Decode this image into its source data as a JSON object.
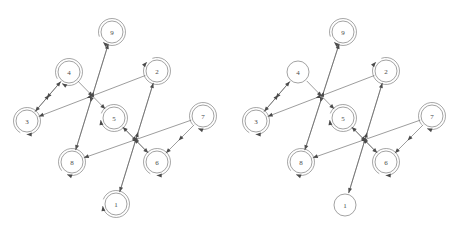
{
  "figure": {
    "title": "",
    "width": 458,
    "height": 232,
    "background": "#ffffff",
    "panel_count": 2
  },
  "style": {
    "edge_color": "#5a5a5a",
    "node_stroke": "#7a7a7a",
    "node_fill": "#ffffff",
    "label_color": "#4a4a4a",
    "arrow_color": "#4a4a4a",
    "node_radius": 11,
    "selfloop_radius": 13.5,
    "edge_width": 0.6
  },
  "panels": [
    {
      "id": "panel-left",
      "name": "left-graph",
      "nodes": [
        {
          "id": "1",
          "label": "1",
          "x": 116,
          "y": 204,
          "selfloop": true,
          "selfloop_angle": 200
        },
        {
          "id": "2",
          "label": "2",
          "x": 157,
          "y": 71,
          "selfloop": true,
          "selfloop_angle": 250
        },
        {
          "id": "3",
          "label": "3",
          "x": 27,
          "y": 121,
          "selfloop": true,
          "selfloop_angle": 120
        },
        {
          "id": "4",
          "label": "4",
          "x": 69,
          "y": 72,
          "selfloop": true,
          "selfloop_angle": 150
        },
        {
          "id": "5",
          "label": "5",
          "x": 114,
          "y": 118,
          "selfloop": true,
          "selfloop_angle": 200
        },
        {
          "id": "6",
          "label": "6",
          "x": 157,
          "y": 162,
          "selfloop": true,
          "selfloop_angle": 120
        },
        {
          "id": "7",
          "label": "7",
          "x": 203,
          "y": 116,
          "selfloop": true,
          "selfloop_angle": 140
        },
        {
          "id": "8",
          "label": "8",
          "x": 72,
          "y": 162,
          "selfloop": true,
          "selfloop_angle": 140
        },
        {
          "id": "9",
          "label": "9",
          "x": 112,
          "y": 32,
          "selfloop": true,
          "selfloop_angle": 160
        }
      ],
      "edges": [
        {
          "from": "9",
          "to": "8",
          "curve": 0.0
        },
        {
          "from": "4",
          "to": "5",
          "curve": 0.0
        },
        {
          "from": "4",
          "to": "3",
          "curve": 0.0
        },
        {
          "from": "2",
          "to": "3",
          "curve": 0.0
        },
        {
          "from": "2",
          "to": "1",
          "curve": 0.0
        },
        {
          "from": "5",
          "to": "6",
          "curve": 0.0
        },
        {
          "from": "7",
          "to": "6",
          "curve": 0.0
        },
        {
          "from": "7",
          "to": "8",
          "curve": 0.0
        },
        {
          "from": "8",
          "to": "9",
          "curve": 0.0
        },
        {
          "from": "1",
          "to": "2",
          "curve": 0.0
        },
        {
          "from": "3",
          "to": "4",
          "curve": 0.0
        },
        {
          "from": "6",
          "to": "5",
          "curve": 0.0
        }
      ]
    },
    {
      "id": "panel-right",
      "name": "right-graph",
      "nodes": [
        {
          "id": "1",
          "label": "1",
          "x": 116,
          "y": 205,
          "selfloop": false,
          "selfloop_angle": 200
        },
        {
          "id": "2",
          "label": "2",
          "x": 157,
          "y": 71,
          "selfloop": true,
          "selfloop_angle": 250
        },
        {
          "id": "3",
          "label": "3",
          "x": 27,
          "y": 121,
          "selfloop": true,
          "selfloop_angle": 120
        },
        {
          "id": "4",
          "label": "4",
          "x": 69,
          "y": 72,
          "selfloop": false,
          "selfloop_angle": 150
        },
        {
          "id": "5",
          "label": "5",
          "x": 114,
          "y": 118,
          "selfloop": true,
          "selfloop_angle": 200
        },
        {
          "id": "6",
          "label": "6",
          "x": 157,
          "y": 162,
          "selfloop": true,
          "selfloop_angle": 120
        },
        {
          "id": "7",
          "label": "7",
          "x": 203,
          "y": 116,
          "selfloop": true,
          "selfloop_angle": 140
        },
        {
          "id": "8",
          "label": "8",
          "x": 72,
          "y": 162,
          "selfloop": true,
          "selfloop_angle": 140
        },
        {
          "id": "9",
          "label": "9",
          "x": 114,
          "y": 32,
          "selfloop": true,
          "selfloop_angle": 160
        }
      ],
      "edges": [
        {
          "from": "9",
          "to": "8",
          "curve": 0.0
        },
        {
          "from": "4",
          "to": "5",
          "curve": 0.0
        },
        {
          "from": "4",
          "to": "3",
          "curve": 0.0
        },
        {
          "from": "2",
          "to": "3",
          "curve": 0.0
        },
        {
          "from": "2",
          "to": "1",
          "curve": 0.0
        },
        {
          "from": "5",
          "to": "6",
          "curve": 0.0
        },
        {
          "from": "7",
          "to": "6",
          "curve": 0.0
        },
        {
          "from": "7",
          "to": "8",
          "curve": 0.0
        },
        {
          "from": "8",
          "to": "9",
          "curve": 0.0
        },
        {
          "from": "1",
          "to": "2",
          "curve": 0.0
        },
        {
          "from": "3",
          "to": "4",
          "curve": 0.0
        },
        {
          "from": "6",
          "to": "5",
          "curve": 0.0
        }
      ]
    }
  ]
}
